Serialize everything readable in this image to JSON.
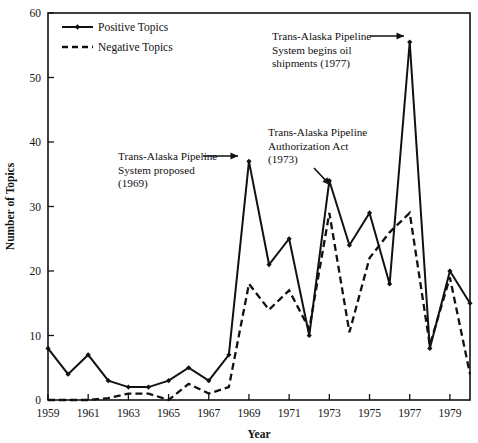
{
  "chart_data": {
    "type": "line",
    "title": "",
    "xlabel": "Year",
    "ylabel": "Number of Topics",
    "xlim": [
      1959,
      1980
    ],
    "ylim": [
      0,
      60
    ],
    "grid": false,
    "legend_position": "top-left",
    "x": [
      1959,
      1960,
      1961,
      1962,
      1963,
      1964,
      1965,
      1966,
      1967,
      1968,
      1969,
      1970,
      1971,
      1972,
      1973,
      1974,
      1975,
      1976,
      1977,
      1978,
      1979,
      1980
    ],
    "xtick_labels": [
      "1959",
      "1961",
      "1963",
      "1965",
      "1967",
      "1969",
      "1971",
      "1973",
      "1975",
      "1977",
      "1979"
    ],
    "xticks": [
      1959,
      1961,
      1963,
      1965,
      1967,
      1969,
      1971,
      1973,
      1975,
      1977,
      1979
    ],
    "ytick_labels": [
      "0",
      "10",
      "20",
      "30",
      "40",
      "50",
      "60"
    ],
    "yticks": [
      0,
      10,
      20,
      30,
      40,
      50,
      60
    ],
    "series": [
      {
        "name": "Positive Topics",
        "style": "solid",
        "marker": "diamond",
        "values": [
          8,
          4,
          7,
          3,
          2,
          2,
          3,
          5,
          3,
          7,
          37,
          21,
          25,
          10,
          34,
          24,
          29,
          18,
          55.5,
          8,
          20,
          15
        ]
      },
      {
        "name": "Negative Topics",
        "style": "dashed",
        "marker": "none",
        "values": [
          0,
          0,
          0,
          0.3,
          1,
          1,
          0,
          2.5,
          1,
          2,
          18,
          14,
          17,
          11,
          29,
          10.5,
          22,
          26,
          29,
          8.5,
          19,
          4
        ]
      }
    ],
    "annotations": [
      {
        "id": "proposed-1969",
        "lines": [
          "Trans-Alaska Pipeline",
          "System proposed",
          "(1969)"
        ],
        "arrow": "right",
        "target_year": 1969,
        "target_value": 37
      },
      {
        "id": "authorization-act-1973",
        "lines": [
          "Trans-Alaska Pipeline",
          "Authorization Act",
          "(1973)"
        ],
        "arrow": "down-right",
        "target_year": 1973,
        "target_value": 34
      },
      {
        "id": "oil-shipments-1977",
        "lines": [
          "Trans-Alaska Pipeline",
          "System begins oil",
          "shipments (1977)"
        ],
        "arrow": "right",
        "target_year": 1977,
        "target_value": 55.5
      }
    ]
  },
  "legend": {
    "items": [
      {
        "label": "Positive Topics",
        "style": "solid"
      },
      {
        "label": "Negative Topics",
        "style": "dashed"
      }
    ]
  },
  "axes": {
    "x_title": "Year",
    "y_title": "Number of Topics"
  },
  "colors": {
    "ink": "#111111",
    "background": "#ffffff"
  }
}
